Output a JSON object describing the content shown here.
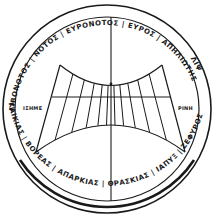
{
  "figure": {
    "ink_color": "#1a1a1a",
    "background_color": "#ffffff"
  },
  "ring": {
    "upper_inscription": "ΛΙΒΟΝΟΤΟΣ | ΝΟΤΟΣ | ΕΥΡΟΝΟΤΟΣ | ΕΥΡΟΣ | ΑΠΗΛΙΩΤΗΣ",
    "upper_right_inscription": "ΛΙΨ",
    "lower_inscription": "ΚΑΙΚΙΑΣ | ΒΟΡΕΑΣ | ΑΠΑΡΚΙΑΣ | ΘΡΑΣΚΙΑΣ | ΙΑΠΥΞ | ΖΕΦΥΡΟΣ",
    "winds": [
      "ΛΙΒΟΝΟΤΟΣ",
      "ΝΟΤΟΣ",
      "ΕΥΡΟΝΟΤΟΣ",
      "ΕΥΡΟΣ",
      "ΑΠΗΛΙΩΤΗΣ",
      "ΚΑΙΚΙΑΣ",
      "ΒΟΡΕΑΣ",
      "ΑΠΑΡΚΙΑΣ",
      "ΘΡΑΣΚΙΑΣ",
      "ΙΑΠΥΞ",
      "ΖΕΦΥΡΟΣ",
      "ΛΙΨ"
    ]
  },
  "labels": {
    "left": "ΙΣΗΜΕ",
    "right": "ΡΙΝΗ"
  },
  "hour_lines": 11
}
